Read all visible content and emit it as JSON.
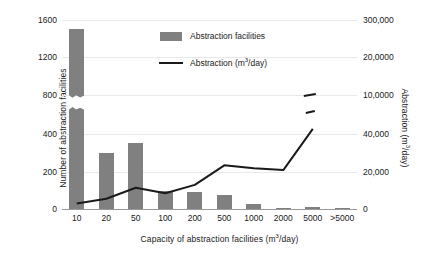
{
  "chart_data": {
    "type": "bar",
    "title": "",
    "xlabel": "Capacity of abstraction facilities (m3/day)",
    "ylabel": "Number of abstraction facilities",
    "ylabel_secondary": "Abstraction (m3/day)",
    "categories": [
      "10",
      "20",
      "50",
      "100",
      "200",
      "500",
      "1000",
      "2000",
      "5000",
      ">5000"
    ],
    "grid": true,
    "legend_position": "inside-top-center",
    "axis_break": true,
    "axis_break_note": "Left axis is non-uniform: equal pixel spacing between 0-200-400-800-1200-1600; bars and line are interrupted between the 400 and 800 levels.",
    "yticks_left": [
      "0",
      "200",
      "400",
      "800",
      "1200",
      "1600"
    ],
    "yticks_right": [
      "0",
      "20,000",
      "40,000",
      "10,0000",
      "20,0000",
      "300,000"
    ],
    "series": [
      {
        "name": "Abstraction facilities",
        "type": "bar",
        "axis": "left",
        "color": "#808080",
        "values": [
          1500,
          300,
          355,
          100,
          90,
          75,
          25,
          8,
          10,
          8
        ]
      },
      {
        "name": "Abstraction (m3/day)",
        "type": "line",
        "axis": "right",
        "color": "#1a1a1a",
        "values": [
          3000,
          5500,
          11500,
          8500,
          13000,
          23500,
          22000,
          21000,
          48000,
          290000
        ]
      }
    ]
  },
  "legend": {
    "items": [
      {
        "label": "Abstraction facilities",
        "marker": "bar-swatch"
      },
      {
        "label": "Abstraction (m3/day)",
        "marker": "line-swatch"
      }
    ]
  },
  "axes": {
    "left": {
      "title_prefix": "Number of abstraction facilities",
      "ticks": [
        {
          "label": "1600",
          "y": 20
        },
        {
          "label": "1200",
          "y": 57
        },
        {
          "label": "800",
          "y": 95
        },
        {
          "label": "400",
          "y": 134
        },
        {
          "label": "200",
          "y": 172
        },
        {
          "label": "0",
          "y": 209
        }
      ]
    },
    "right": {
      "title_prefix": "Abstraction (m",
      "title_sup": "3",
      "title_suffix": "/day)",
      "ticks": [
        {
          "label": "300,000",
          "y": 20
        },
        {
          "label": "20,0000",
          "y": 57
        },
        {
          "label": "10,0000",
          "y": 95
        },
        {
          "label": "40,000",
          "y": 134
        },
        {
          "label": "20,000",
          "y": 172
        },
        {
          "label": "0",
          "y": 209
        }
      ]
    },
    "x": {
      "title_prefix": "Capacity of abstraction facilities (m",
      "title_sup": "3",
      "title_suffix": "/day)"
    }
  }
}
